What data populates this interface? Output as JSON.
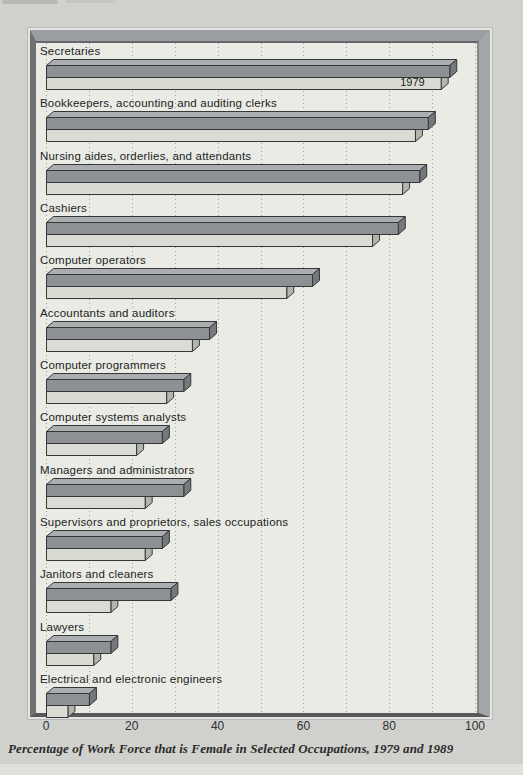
{
  "page": {
    "caption": "Percentage of Work Force that is Female in Selected Occupations, 1979 and 1989"
  },
  "chart_data": {
    "type": "bar",
    "orientation": "horizontal",
    "caption": "Percentage of Work Force that is Female in Selected Occupations, 1979 and 1989",
    "xlabel": "",
    "ylabel": "",
    "xlim": [
      0,
      100
    ],
    "xticks": [
      0,
      20,
      40,
      60,
      80,
      100
    ],
    "gridlines_every": 10,
    "grid_style": "dotted-vertical",
    "legend": "none (only the 1979 bar of the first category is labeled in-bar)",
    "categories": [
      "Secretaries",
      "Bookkeepers, accounting and auditing clerks",
      "Nursing aides, orderlies, and attendants",
      "Cashiers",
      "Computer operators",
      "Accountants and auditors",
      "Computer programmers",
      "Computer systems analysts",
      "Managers and administrators",
      "Supervisors and proprietors, sales occupations",
      "Janitors and cleaners",
      "Lawyers",
      "Electrical and electronic engineers"
    ],
    "series": [
      {
        "name": "1989",
        "position": "top-dark-bar",
        "values": [
          94,
          89,
          87,
          82,
          62,
          38,
          32,
          27,
          32,
          27,
          29,
          15,
          10
        ]
      },
      {
        "name": "1979",
        "position": "bottom-light-bar",
        "values": [
          92,
          86,
          83,
          76,
          56,
          34,
          28,
          21,
          23,
          23,
          15,
          11,
          5
        ]
      }
    ],
    "bar_annotation": {
      "text": "1979",
      "category_index": 0,
      "series": "1979"
    },
    "colors": {
      "bar_1989_front": "#8d9193",
      "bar_1989_top": "#aaaeaf",
      "bar_1989_side": "#75797b",
      "bar_1979_front": "#dadbd3",
      "bar_1979_top": "#c8c9c0",
      "bar_1979_side": "#b3b5ac",
      "outline": "#34373a",
      "panel_bg": "#e9ebe4",
      "page_bg": "#d0d1cd",
      "frame": "#9b9fa1"
    }
  }
}
